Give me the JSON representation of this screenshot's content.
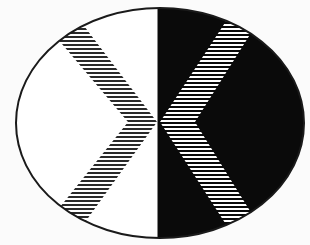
{
  "figure": {
    "colors": {
      "background": "#fbfbfb",
      "light_half": "#ffffff",
      "dark_half": "#0a0a0a",
      "outline": "#1a1a1a",
      "hatch_on_light": "#2a2a2a",
      "hatch_on_dark": "#ffffff"
    },
    "ellipse": {
      "cx": 160,
      "cy": 123,
      "rx": 144,
      "ry": 115
    },
    "divider_x": 158,
    "left_chevron": {
      "direction": "right",
      "outer": [
        [
          40,
          18
        ],
        [
          128,
          122
        ],
        [
          40,
          232
        ]
      ],
      "inner": [
        [
          78,
          18
        ],
        [
          157,
          122
        ],
        [
          78,
          232
        ]
      ]
    },
    "right_chevron": {
      "direction": "left",
      "outer": [
        [
          236,
          6
        ],
        [
          160,
          122
        ],
        [
          236,
          240
        ]
      ],
      "inner": [
        [
          268,
          6
        ],
        [
          195,
          122
        ],
        [
          268,
          240
        ]
      ]
    },
    "hatch_spacing": 4
  }
}
